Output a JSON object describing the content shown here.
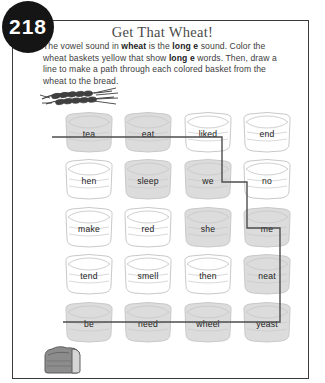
{
  "page": {
    "number": "218",
    "title": "Get That Wheat!"
  },
  "instructions": {
    "part1": "The vowel sound in ",
    "bold1": "wheat",
    "part2": " is the ",
    "bold2": "long e",
    "part3": " sound. Color the wheat baskets yellow that show ",
    "bold3": "long e",
    "part4": " words. Then, draw a line to make a path through each colored basket from the wheat to the bread."
  },
  "illustrations": {
    "wheat_label": "wheat-stalks",
    "bread_label": "bread-loaf"
  },
  "colors": {
    "badge_background": "#151515",
    "badge_text": "#ffffff",
    "border": "#3a3a3a",
    "title_text": "#4a4a4a",
    "body_text": "#3d3d3d",
    "basket_shaded_fill": "#dcdcdc",
    "basket_plain_fill": "#ffffff",
    "basket_outline": "#c9c9c9",
    "path_line": "#4d4d4d",
    "bread_fill": "#8c8c8c"
  },
  "grid": {
    "rows": [
      {
        "cells": [
          {
            "word": "tea",
            "colored": true
          },
          {
            "word": "eat",
            "colored": true
          },
          {
            "word": "liked",
            "colored": false
          },
          {
            "word": "end",
            "colored": false
          }
        ]
      },
      {
        "cells": [
          {
            "word": "hen",
            "colored": false
          },
          {
            "word": "sleep",
            "colored": true
          },
          {
            "word": "we",
            "colored": true
          },
          {
            "word": "no",
            "colored": false
          }
        ]
      },
      {
        "cells": [
          {
            "word": "make",
            "colored": false
          },
          {
            "word": "red",
            "colored": false
          },
          {
            "word": "she",
            "colored": true
          },
          {
            "word": "me",
            "colored": true
          }
        ]
      },
      {
        "cells": [
          {
            "word": "tend",
            "colored": false
          },
          {
            "word": "smell",
            "colored": false
          },
          {
            "word": "then",
            "colored": false
          },
          {
            "word": "neat",
            "colored": true
          }
        ]
      },
      {
        "cells": [
          {
            "word": "be",
            "colored": true
          },
          {
            "word": "need",
            "colored": true
          },
          {
            "word": "wheel",
            "colored": true
          },
          {
            "word": "yeast",
            "colored": true
          }
        ]
      }
    ]
  },
  "path": {
    "points": "52,137 222,137 222,182 247,182 247,228 280,228 280,275 280,322 63,322"
  },
  "layout": {
    "col_x": [
      58,
      117,
      177,
      236
    ],
    "row_y": [
      110,
      157,
      205,
      252,
      300
    ]
  }
}
